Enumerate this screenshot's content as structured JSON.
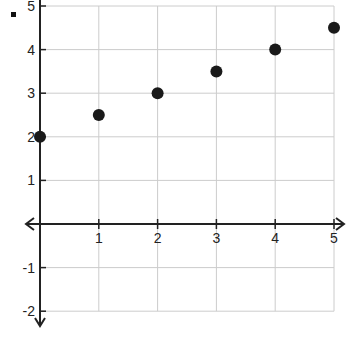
{
  "bullet": "■",
  "chart_data": {
    "type": "scatter",
    "title": "",
    "xlabel": "",
    "ylabel": "",
    "x": [
      0,
      1,
      2,
      3,
      4,
      5
    ],
    "series": [
      {
        "name": "points",
        "values": [
          2,
          2.5,
          3,
          3.5,
          4,
          4.5
        ]
      }
    ],
    "xlim": [
      0,
      5
    ],
    "ylim": [
      -2,
      5
    ],
    "x_ticks": [
      1,
      2,
      3,
      4,
      5
    ],
    "y_ticks": [
      5,
      4,
      3,
      2,
      1,
      -1,
      -2
    ],
    "grid": true,
    "axes_arrows": [
      "left",
      "right",
      "down"
    ],
    "marker_color": "#1a1a1a",
    "grid_color": "#cccccc",
    "axis_color": "#222222"
  }
}
